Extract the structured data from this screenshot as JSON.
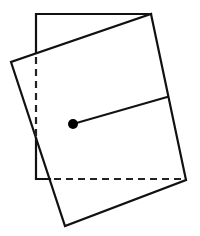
{
  "diagram": {
    "colors": {
      "stroke": "#111111",
      "background": "#ffffff",
      "dot": "#000000"
    },
    "original_square": {
      "top_left": [
        36,
        14
      ],
      "top_right": [
        151,
        14
      ],
      "bottom_left": [
        36,
        179
      ],
      "bottom_right": [
        186,
        179
      ],
      "hidden_left_segment": [
        [
          36,
          53
        ],
        [
          36,
          138
        ]
      ],
      "hidden_bottom_segment": [
        [
          50,
          179
        ],
        [
          186,
          179
        ]
      ]
    },
    "rotated_square": {
      "corners": [
        [
          151,
          14
        ],
        [
          186,
          180
        ],
        [
          65,
          226
        ],
        [
          11,
          62
        ]
      ]
    },
    "center_point": {
      "x": 73,
      "y": 124,
      "r": 5
    },
    "radius_line_end": {
      "x": 167,
      "y": 97
    }
  }
}
